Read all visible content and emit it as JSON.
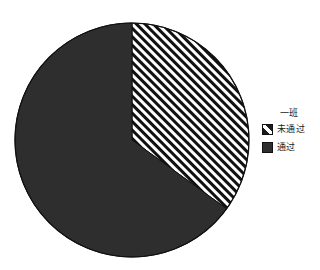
{
  "chart_data": {
    "type": "pie",
    "title": "一班",
    "categories": [
      "未通过",
      "通过"
    ],
    "values": [
      35,
      65
    ],
    "labels": [
      "未通过",
      "通过"
    ],
    "xlabel": "",
    "ylabel": "",
    "legend_position": "right",
    "grid": false,
    "slices": [
      {
        "name": "未通过",
        "value": 35,
        "percent": 35,
        "start_angle_deg": 0,
        "end_angle_deg": 126,
        "fill": "hatch-diagonal",
        "color": "#FFFFFF",
        "hatch_color": "#111111"
      },
      {
        "name": "通过",
        "value": 65,
        "percent": 65,
        "start_angle_deg": 126,
        "end_angle_deg": 360,
        "fill": "solid",
        "color": "#2E2E2E",
        "hatch_color": ""
      }
    ]
  },
  "legend": {
    "title": "一班",
    "items": [
      {
        "label": "未通过",
        "swatch": "hatched-swatch"
      },
      {
        "label": "通过",
        "swatch": "solid-swatch"
      }
    ]
  },
  "colors": {
    "passed": "#2E2E2E",
    "not_passed_background": "#FFFFFF",
    "hatch": "#111111",
    "outline": "#111111",
    "page_background": "#FFFFFF",
    "text": "#1A1A1A"
  },
  "geometry": {
    "center_x": 132,
    "center_y": 140,
    "radius": 117
  }
}
